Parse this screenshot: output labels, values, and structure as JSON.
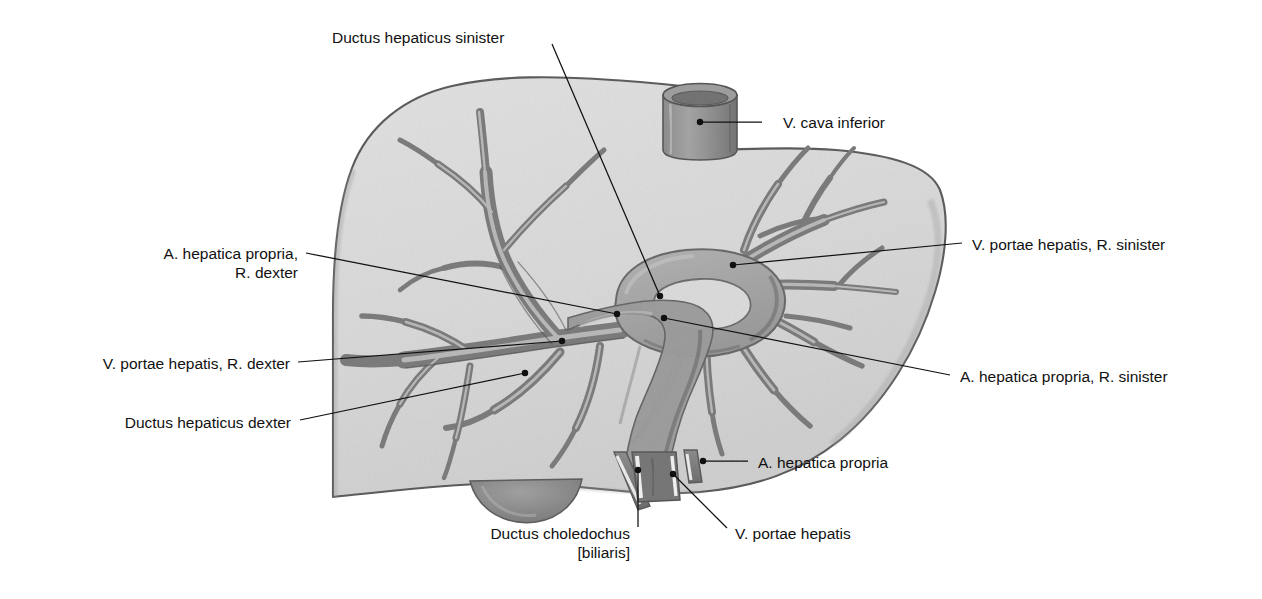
{
  "figure": {
    "style": "pencil-shaded anatomical drawing, grayscale",
    "colors": {
      "background": "#ffffff",
      "parenchyma_light": "#dcdcdc",
      "parenchyma_edge": "#5d5d5d",
      "vessel_mid": "#9a9a9a",
      "vessel_dark": "#6e6e6e",
      "hilum_fill": "#a8a8a8",
      "stump_dark": "#7b7b7b",
      "gallbladder": "#8b8b8b",
      "leader_line": "#111111",
      "label_text": "#111111"
    }
  },
  "labels": [
    {
      "id": "ductus-hepaticus-sinister",
      "lines": [
        "Ductus hepaticus sinister"
      ],
      "align": "left",
      "text_x": 332,
      "text_y": 28,
      "leader": [
        [
          552,
          44
        ],
        [
          660,
          296
        ]
      ],
      "dot": true
    },
    {
      "id": "v-cava-inferior",
      "lines": [
        "V. cava inferior"
      ],
      "align": "left",
      "text_x": 783,
      "text_y": 113,
      "leader": [
        [
          762,
          122
        ],
        [
          700,
          122
        ]
      ],
      "dot": true
    },
    {
      "id": "v-portae-hepatis-r-sinister",
      "lines": [
        "V. portae hepatis, R. sinister"
      ],
      "align": "left",
      "text_x": 972,
      "text_y": 235,
      "leader": [
        [
          962,
          243
        ],
        [
          733,
          265
        ]
      ],
      "dot": true
    },
    {
      "id": "a-hepatica-propria-r-dexter",
      "lines": [
        "A. hepatica propria,",
        "R. dexter"
      ],
      "align": "right",
      "text_x": 138,
      "text_y": 244,
      "text_w": 160,
      "leader": [
        [
          306,
          253
        ],
        [
          617,
          314
        ]
      ],
      "dot": true
    },
    {
      "id": "v-portae-hepatis-r-dexter",
      "lines": [
        "V. portae hepatis, R. dexter"
      ],
      "align": "right",
      "text_x": 68,
      "text_y": 354,
      "text_w": 222,
      "leader": [
        [
          298,
          362
        ],
        [
          562,
          341
        ]
      ],
      "dot": true
    },
    {
      "id": "a-hepatica-propria-r-sinister",
      "lines": [
        "A. hepatica propria, R. sinister"
      ],
      "align": "left",
      "text_x": 960,
      "text_y": 367,
      "leader": [
        [
          950,
          375
        ],
        [
          664,
          318
        ]
      ],
      "dot": true
    },
    {
      "id": "ductus-hepaticus-dexter",
      "lines": [
        "Ductus hepaticus dexter"
      ],
      "align": "right",
      "text_x": 101,
      "text_y": 413,
      "text_w": 190,
      "leader": [
        [
          300,
          420
        ],
        [
          525,
          373
        ]
      ],
      "dot": true
    },
    {
      "id": "a-hepatica-propria",
      "lines": [
        "A. hepatica propria"
      ],
      "align": "left",
      "text_x": 758,
      "text_y": 453,
      "leader": [
        [
          748,
          461
        ],
        [
          703,
          461
        ]
      ],
      "dot": true
    },
    {
      "id": "v-portae-hepatis",
      "lines": [
        "V. portae hepatis"
      ],
      "align": "left",
      "text_x": 735,
      "text_y": 524,
      "leader": [
        [
          727,
          528
        ],
        [
          673,
          474
        ]
      ],
      "dot": true
    },
    {
      "id": "ductus-choledochus-biliaris",
      "lines": [
        "Ductus choledochus",
        "[biliaris]"
      ],
      "align": "right",
      "text_x": 470,
      "text_y": 524,
      "text_w": 160,
      "leader": [
        [
          638,
          527
        ],
        [
          638,
          470
        ]
      ],
      "dot": true
    }
  ],
  "structures": [
    {
      "id": "liver-outline",
      "name": "liver silhouette"
    },
    {
      "id": "vena-cava-stump",
      "name": "V. cava inferior stump (cylinder, top)"
    },
    {
      "id": "gallbladder",
      "name": "gallbladder bulge (inferior border)"
    },
    {
      "id": "portal-vein-tree",
      "name": "portal vein branching tree"
    },
    {
      "id": "hepatic-artery-tree",
      "name": "hepatic artery branches"
    },
    {
      "id": "bile-duct-tree",
      "name": "bile duct branches"
    },
    {
      "id": "hilum-ring",
      "name": "hilar vascular ring / oval loop"
    },
    {
      "id": "ductus-choledochus-stump",
      "name": "common bile duct stump"
    },
    {
      "id": "portal-vein-stump",
      "name": "portal vein stump"
    },
    {
      "id": "hepatic-artery-stump",
      "name": "hepatic artery stump"
    }
  ]
}
